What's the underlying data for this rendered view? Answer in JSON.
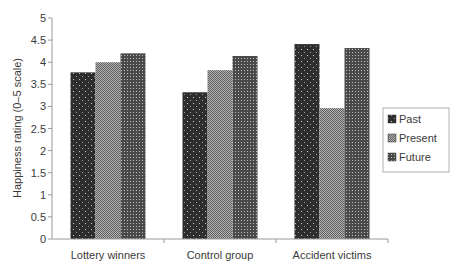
{
  "chart_data": {
    "type": "bar",
    "title": "",
    "xlabel": "",
    "ylabel": "Happiness rating (0–5 scale)",
    "ylim": [
      0,
      5
    ],
    "yticks": [
      0,
      0.5,
      1,
      1.5,
      2,
      2.5,
      3,
      3.5,
      4,
      4.5,
      5
    ],
    "ytick_labels": [
      "0",
      "0.5",
      "1",
      "1.5",
      "2",
      "2.5",
      "3",
      "3.5",
      "4",
      "4.5",
      "5"
    ],
    "grid": false,
    "legend_position": "right",
    "categories": [
      "Lottery winners",
      "Control group",
      "Accident victims"
    ],
    "series": [
      {
        "name": "Past",
        "values": [
          3.77,
          3.32,
          4.41
        ]
      },
      {
        "name": "Present",
        "values": [
          4.0,
          3.82,
          2.96
        ]
      },
      {
        "name": "Future",
        "values": [
          4.2,
          4.14,
          4.32
        ]
      }
    ]
  },
  "colors": {
    "axis": "#9a9a9a",
    "text": "#3a3a3a",
    "past_fill": "#2e2e2e",
    "present_fill": "#8c8c8c",
    "future_fill": "#5a5a5a"
  }
}
